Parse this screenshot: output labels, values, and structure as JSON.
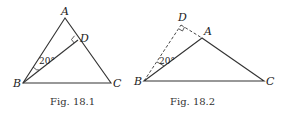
{
  "figures": [
    {
      "caption": "Fig. 18.1",
      "points": {
        "A": "A",
        "B": "B",
        "C": "C",
        "D": "D"
      },
      "angle_label": "20°",
      "right_angle_at": "D"
    },
    {
      "caption": "Fig. 18.2",
      "points": {
        "A": "A",
        "B": "B",
        "C": "C",
        "D": "D"
      },
      "angle_label": "20°",
      "right_angle_at": "D"
    }
  ],
  "colors": {
    "stroke": "#333333",
    "background": "#ffffff"
  }
}
